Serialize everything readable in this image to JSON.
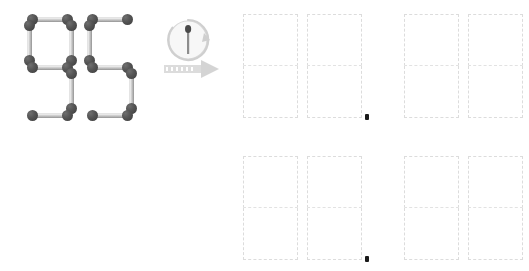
{
  "canvas": {
    "width": 529,
    "height": 271,
    "background": "#ffffff"
  },
  "puzzle": {
    "type": "matchstick-equation",
    "instruction_icon": "move-one-matchstick-icon",
    "given_expression": "95",
    "given_digits": [
      {
        "value": "9",
        "segments": [
          "top",
          "top-left",
          "top-right",
          "middle",
          "bottom-right",
          "bottom"
        ],
        "matchstick_count": 6
      },
      {
        "value": "5",
        "segments": [
          "top",
          "top-left",
          "middle",
          "bottom-right",
          "bottom"
        ],
        "matchstick_count": 5
      }
    ],
    "total_matchsticks": 11
  },
  "transform": {
    "icon_name": "move-one-matchstick-icon",
    "arrow_direction": "right",
    "rotation_hint": "clockwise",
    "matchstick_glyph": "single-matchstick"
  },
  "answers": {
    "rows": [
      {
        "row_index": 0,
        "pairs": [
          {
            "pair_index": 0,
            "slots": [
              {
                "value": ""
              },
              {
                "value": ""
              }
            ]
          },
          {
            "pair_index": 1,
            "slots": [
              {
                "value": ""
              },
              {
                "value": ""
              }
            ]
          }
        ],
        "cursor_visible": true
      },
      {
        "row_index": 1,
        "pairs": [
          {
            "pair_index": 0,
            "slots": [
              {
                "value": ""
              },
              {
                "value": ""
              }
            ]
          },
          {
            "pair_index": 1,
            "slots": [
              {
                "value": ""
              },
              {
                "value": ""
              }
            ]
          }
        ],
        "cursor_visible": true
      }
    ],
    "slot_style": "dashed-seven-segment-outline",
    "empty": true
  },
  "colors": {
    "background": "#ffffff",
    "match_head": "#3c3c3c",
    "match_shaft": "#c9c9c9",
    "match_shaft_highlight": "#f2f2f2",
    "slot_outline": "#dcdcdc",
    "arrow": "#d4d4d4",
    "cursor": "#1a1a1a"
  }
}
